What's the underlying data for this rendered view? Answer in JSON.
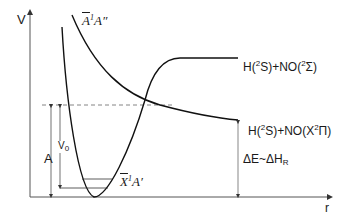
{
  "diagram": {
    "axes": {
      "y_label": "V",
      "x_label": "r"
    },
    "states": {
      "excited": {
        "tilde_letter": "A",
        "sup": "1",
        "label_rest": "A″"
      },
      "ground": {
        "tilde_letter": "X",
        "sup": "1",
        "label_rest": "A′"
      }
    },
    "asymptotes": {
      "upper": {
        "prefix": "H(",
        "sup1": "2",
        "mid": "S)+NO(",
        "sup2": "2",
        "tail": "Σ)"
      },
      "lower": {
        "prefix": "H(",
        "sup1": "2",
        "mid": "S)+NO(X",
        "sup2": "2",
        "tail": "Π)"
      }
    },
    "annotations": {
      "A": "A",
      "V0_main": "V",
      "V0_sub": "0",
      "delta_main": "ΔE~ΔH",
      "delta_sub": "R"
    }
  }
}
